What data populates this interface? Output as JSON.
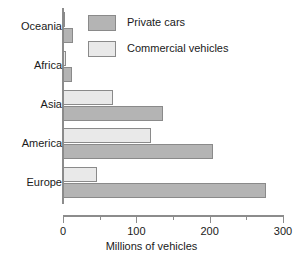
{
  "chart_data": {
    "type": "bar",
    "orientation": "horizontal",
    "title": "",
    "xlabel": "Millions of vehicles",
    "ylabel": "",
    "xlim": [
      0,
      300
    ],
    "xticks": [
      0,
      50,
      100,
      150,
      200,
      250,
      300
    ],
    "xtick_labels": [
      "0",
      "",
      "100",
      "",
      "200",
      "",
      "300"
    ],
    "major_ticks": [
      0,
      100,
      200,
      300
    ],
    "minor_ticks": [
      50,
      150,
      250
    ],
    "grid": false,
    "legend_position": "top-right-inside",
    "categories": [
      "Oceania",
      "Africa",
      "Asia",
      "America",
      "Europe"
    ],
    "series": [
      {
        "name": "Private cars",
        "color": "#b4b4b4",
        "values": [
          13,
          12,
          136,
          205,
          277
        ]
      },
      {
        "name": "Commercial vehicles",
        "color": "#e9e9e9",
        "values": [
          3,
          4,
          68,
          120,
          46
        ]
      }
    ]
  },
  "legend": {
    "items": [
      {
        "label": "Private cars",
        "swatch": "private"
      },
      {
        "label": "Commercial vehicles",
        "swatch": "commercial"
      }
    ]
  },
  "colors": {
    "private": "#b4b4b4",
    "commercial": "#e9e9e9",
    "axis": "#8c8c8c",
    "outline": "#8a8a8a",
    "text": "#1a1a1a",
    "background": "#ffffff"
  }
}
